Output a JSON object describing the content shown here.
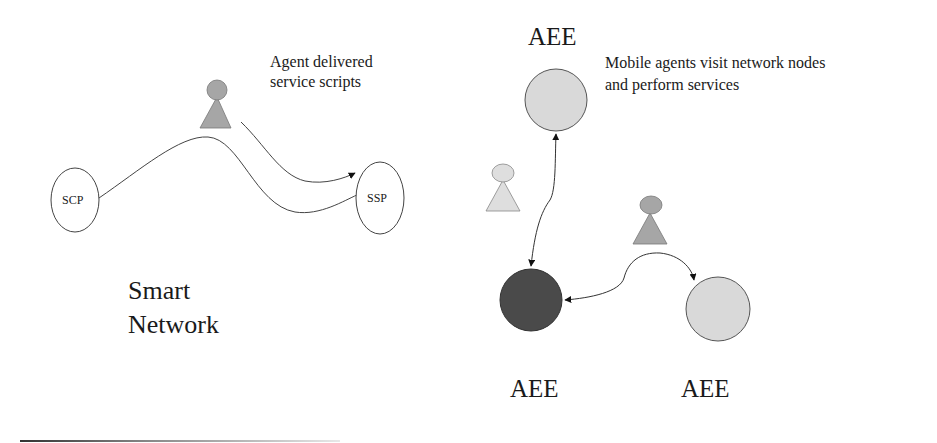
{
  "left_panel": {
    "caption_line1": "Agent delivered",
    "caption_line2": "service scripts",
    "title_line1": "Smart",
    "title_line2": "Network",
    "nodes": [
      {
        "id": "scp",
        "label": "SCP"
      },
      {
        "id": "ssp",
        "label": "SSP"
      }
    ]
  },
  "right_panel": {
    "caption_line1": "Mobile agents visit network nodes",
    "caption_line2": "and perform services",
    "nodes": [
      {
        "id": "aee-top",
        "label": "AEE",
        "fill": "#d9d9d9"
      },
      {
        "id": "aee-bottom-left",
        "label": "AEE",
        "fill": "#4a4a4a"
      },
      {
        "id": "aee-bottom-right",
        "label": "AEE",
        "fill": "#d9d9d9"
      }
    ]
  },
  "colors": {
    "agent_dark": "#a6a6a6",
    "agent_light": "#dedede",
    "node_light": "#d9d9d9",
    "node_dark": "#4a4a4a",
    "stroke": "#444444"
  }
}
